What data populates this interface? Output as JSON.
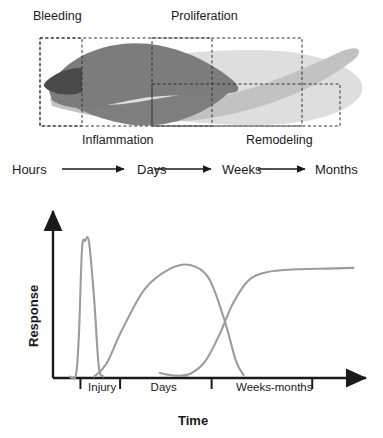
{
  "figure": {
    "panels": [
      "phase-diagram",
      "response-curve-chart"
    ]
  },
  "top_panel": {
    "phase_labels": [
      {
        "name": "bleeding",
        "text": "Bleeding",
        "x": 33,
        "y": 10,
        "position": "above-left"
      },
      {
        "name": "proliferation",
        "text": "Proliferation",
        "x": 171,
        "y": 10,
        "position": "above-right"
      },
      {
        "name": "inflammation",
        "text": "Inflammation",
        "x": 82,
        "y": 134,
        "position": "below-left"
      },
      {
        "name": "remodeling",
        "text": "Remodeling",
        "x": 246,
        "y": 134,
        "position": "below-right"
      }
    ],
    "phase_boxes": [
      {
        "name": "bleeding-box",
        "x": 40,
        "y": 38,
        "w": 42,
        "h": 88
      },
      {
        "name": "inflammation-box",
        "x": 40,
        "y": 38,
        "w": 172,
        "h": 88
      },
      {
        "name": "proliferation-box",
        "x": 152,
        "y": 38,
        "w": 150,
        "h": 88
      },
      {
        "name": "remodeling-box",
        "x": 152,
        "y": 84,
        "w": 188,
        "h": 42
      }
    ],
    "band_colors": {
      "bleeding": "#4a4a4a",
      "inflammation": "#7c7c7c",
      "proliferation": "#c2c2c2",
      "remodeling": "#dedede"
    },
    "timeline": {
      "items": [
        "Hours",
        "Days",
        "Weeks",
        "Months"
      ],
      "item_x": [
        12,
        137,
        222,
        315
      ],
      "arrows": 3
    }
  },
  "chart_data": {
    "type": "line",
    "title": "",
    "xlabel": "Time",
    "ylabel": "Response",
    "grid": false,
    "legend": "none",
    "axis_arrows": true,
    "line_color": "#9c9c9c",
    "axis_color": "#1a1a1a",
    "xlim": [
      0,
      1
    ],
    "ylim": [
      0,
      1
    ],
    "xticks": [
      0.09,
      0.22,
      0.52,
      0.85
    ],
    "xtick_labels": [
      "Injury",
      "Days",
      "Weeks-months"
    ],
    "xtick_label_x": [
      0.115,
      0.32,
      0.6
    ],
    "yticks": [],
    "ytick_labels": [],
    "series": [
      {
        "name": "bleeding",
        "comment": "narrow tall spike just after injury",
        "x": [
          0.055,
          0.075,
          0.085,
          0.095,
          0.105,
          0.118,
          0.135,
          0.15,
          0.165
        ],
        "y": [
          0.01,
          0.02,
          0.3,
          0.9,
          0.96,
          0.95,
          0.55,
          0.08,
          0.01
        ]
      },
      {
        "name": "inflammation",
        "comment": "broad hump peaking in the days range",
        "x": [
          0.135,
          0.175,
          0.225,
          0.3,
          0.38,
          0.45,
          0.51,
          0.56,
          0.6,
          0.625
        ],
        "y": [
          0.01,
          0.1,
          0.33,
          0.62,
          0.76,
          0.79,
          0.7,
          0.42,
          0.12,
          0.02
        ]
      },
      {
        "name": "proliferation",
        "comment": "sigmoid rise to plateau over weeks-months",
        "x": [
          0.4,
          0.45,
          0.5,
          0.545,
          0.59,
          0.64,
          0.7,
          0.8,
          0.9,
          0.985
        ],
        "y": [
          0.015,
          0.03,
          0.12,
          0.3,
          0.52,
          0.68,
          0.74,
          0.76,
          0.765,
          0.77
        ]
      },
      {
        "name": "remodeling-tail",
        "comment": "short low tail near baseline after inflammation falls",
        "x": [
          0.35,
          0.4,
          0.44
        ],
        "y": [
          0.035,
          0.015,
          0.015
        ]
      }
    ]
  }
}
